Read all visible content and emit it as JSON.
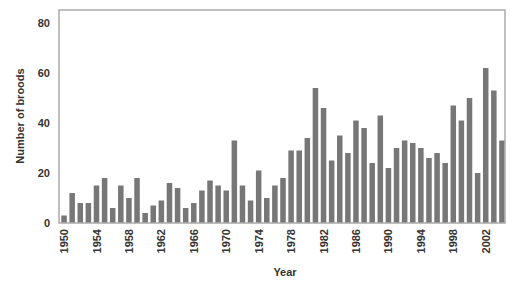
{
  "chart_data": {
    "type": "bar",
    "title": "",
    "xlabel": "Year",
    "ylabel": "Number of broods",
    "ylim": [
      0,
      85
    ],
    "yticks": [
      0,
      20,
      40,
      60,
      80
    ],
    "xtick_labels": [
      "1950",
      "1954",
      "1958",
      "1962",
      "1966",
      "1970",
      "1974",
      "1978",
      "1982",
      "1986",
      "1990",
      "1994",
      "1998",
      "2002"
    ],
    "grid": false,
    "legend": null,
    "bar_color": "#777777",
    "categories": [
      1950,
      1951,
      1952,
      1953,
      1954,
      1955,
      1956,
      1957,
      1958,
      1959,
      1960,
      1961,
      1962,
      1963,
      1964,
      1965,
      1966,
      1967,
      1968,
      1969,
      1970,
      1971,
      1972,
      1973,
      1974,
      1975,
      1976,
      1977,
      1978,
      1979,
      1980,
      1981,
      1982,
      1983,
      1984,
      1985,
      1986,
      1987,
      1988,
      1989,
      1990,
      1991,
      1992,
      1993,
      1994,
      1995,
      1996,
      1997,
      1998,
      1999,
      2000,
      2001,
      2002,
      2003,
      2004
    ],
    "values": [
      3,
      12,
      8,
      8,
      15,
      18,
      6,
      15,
      10,
      18,
      4,
      7,
      9,
      16,
      14,
      6,
      8,
      13,
      17,
      15,
      13,
      33,
      15,
      9,
      21,
      10,
      15,
      18,
      29,
      29,
      34,
      54,
      46,
      25,
      35,
      28,
      41,
      38,
      24,
      43,
      22,
      30,
      33,
      32,
      30,
      26,
      28,
      24,
      47,
      41,
      50,
      20,
      62,
      53,
      33
    ]
  }
}
